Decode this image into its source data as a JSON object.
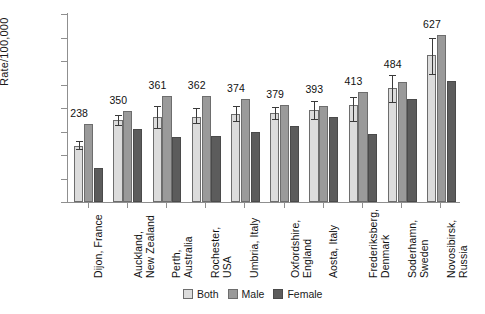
{
  "chart_data": {
    "type": "bar",
    "title": "",
    "xlabel": "",
    "ylabel": "Rate/100,000",
    "ylim": [
      0,
      800
    ],
    "ytick_step": 100,
    "yticks": [
      "0",
      "100",
      "200",
      "300",
      "400",
      "500",
      "600",
      "700",
      "800"
    ],
    "grid": false,
    "legend_position": "bottom-center",
    "categories": [
      "Dijon, France",
      "Auckland,\nNew Zealand",
      "Perth, Australia",
      "Rochester, USA",
      "Umbria, Italy",
      "Oxfordshire,\nEngland",
      "Aosta, Italy",
      "Frederiksberg,\nDenmark",
      "Soderhamn,\nSweden",
      "Novosibirsk,\nRussia"
    ],
    "series": [
      {
        "name": "Both",
        "color": "#dcdcdc",
        "values": [
          238,
          350,
          361,
          362,
          374,
          379,
          393,
          413,
          484,
          627
        ],
        "error_low": [
          220,
          325,
          310,
          330,
          340,
          350,
          348,
          340,
          420,
          540
        ],
        "error_high": [
          258,
          372,
          408,
          398,
          408,
          405,
          432,
          448,
          540,
          700
        ]
      },
      {
        "name": "Male",
        "color": "#9a9a9a",
        "values": [
          331,
          388,
          450,
          451,
          440,
          412,
          407,
          470,
          512,
          712
        ]
      },
      {
        "name": "Female",
        "color": "#5c5c5c",
        "values": [
          146,
          309,
          277,
          281,
          296,
          322,
          360,
          288,
          440,
          515
        ]
      }
    ],
    "value_labels": [
      238,
      350,
      361,
      362,
      374,
      379,
      393,
      413,
      484,
      627
    ],
    "value_label_series": "Both"
  },
  "legend": {
    "items": [
      {
        "label": "Both",
        "key": "both"
      },
      {
        "label": "Male",
        "key": "male"
      },
      {
        "label": "Female",
        "key": "female"
      }
    ]
  },
  "colors": {
    "both": "#dcdcdc",
    "male": "#9a9a9a",
    "female": "#5c5c5c",
    "axis": "#8f8f8f",
    "text": "#111111",
    "background": "#ffffff"
  }
}
